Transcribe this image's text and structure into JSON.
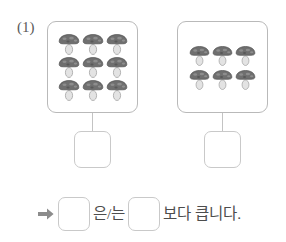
{
  "worksheet": {
    "problem_number": "(1)",
    "arrow_icon": "right-arrow-icon",
    "accent_color": "#8c8c8c",
    "box_border_color": "#b9b9b9",
    "text_color": "#4d4d4d"
  },
  "groups": [
    {
      "id": "left",
      "item_icon": "mushroom-icon",
      "count": 9,
      "rows": [
        3,
        3,
        3
      ],
      "answer_value": "",
      "answer_placeholder": ""
    },
    {
      "id": "right",
      "item_icon": "mushroom-icon",
      "count": 6,
      "rows": [
        3,
        3
      ],
      "answer_value": "",
      "answer_placeholder": ""
    }
  ],
  "sentence": {
    "blank_first_value": "",
    "particle": "은/는",
    "blank_second_value": "",
    "predicate": "보다 큽니다."
  }
}
